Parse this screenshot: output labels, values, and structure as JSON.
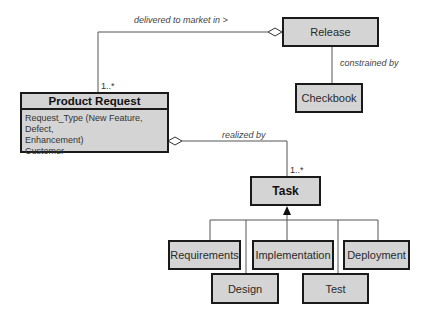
{
  "diagram": {
    "classes": {
      "product_request": {
        "name": "Product Request",
        "attributes": [
          "Request_Type (New Feature, Defect,",
          "Enhancement)",
          "Customer"
        ]
      },
      "release": {
        "name": "Release"
      },
      "checkbook": {
        "name": "Checkbook"
      },
      "task": {
        "name": "Task"
      },
      "requirements": {
        "name": "Requirements"
      },
      "implementation": {
        "name": "Implementation"
      },
      "deployment": {
        "name": "Deployment"
      },
      "design": {
        "name": "Design"
      },
      "test": {
        "name": "Test"
      }
    },
    "associations": {
      "delivered": {
        "label": "delivered to market  in >",
        "multiplicity": "1..*"
      },
      "constrained": {
        "label": "constrained by"
      },
      "realized": {
        "label": "realized by",
        "multiplicity": "1..*"
      }
    },
    "colors": {
      "box_fill": "#d4d4d4",
      "box_border": "#1a1a1a",
      "line": "#555555"
    }
  }
}
